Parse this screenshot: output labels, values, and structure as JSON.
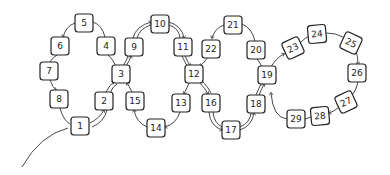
{
  "diagram": {
    "type": "hand-drawn loop path diagram",
    "nodes": [
      {
        "id": "1",
        "label": "1",
        "x": 80,
        "y": 126,
        "rot": 0
      },
      {
        "id": "2",
        "label": "2",
        "x": 104,
        "y": 101,
        "rot": 0
      },
      {
        "id": "3",
        "label": "3",
        "x": 121,
        "y": 74,
        "rot": 0
      },
      {
        "id": "4",
        "label": "4",
        "x": 106,
        "y": 46,
        "rot": 0
      },
      {
        "id": "5",
        "label": "5",
        "x": 84,
        "y": 23,
        "rot": 0
      },
      {
        "id": "6",
        "label": "6",
        "x": 60,
        "y": 46,
        "rot": 0
      },
      {
        "id": "7",
        "label": "7",
        "x": 49,
        "y": 71,
        "rot": 0
      },
      {
        "id": "8",
        "label": "8",
        "x": 59,
        "y": 99,
        "rot": 0
      },
      {
        "id": "9",
        "label": "9",
        "x": 134,
        "y": 47,
        "rot": 0
      },
      {
        "id": "10",
        "label": "10",
        "x": 160,
        "y": 24,
        "rot": 0
      },
      {
        "id": "11",
        "label": "11",
        "x": 183,
        "y": 47,
        "rot": 0
      },
      {
        "id": "12",
        "label": "12",
        "x": 194,
        "y": 74,
        "rot": 0
      },
      {
        "id": "13",
        "label": "13",
        "x": 181,
        "y": 103,
        "rot": 0
      },
      {
        "id": "14",
        "label": "14",
        "x": 156,
        "y": 128,
        "rot": 0
      },
      {
        "id": "15",
        "label": "15",
        "x": 135,
        "y": 101,
        "rot": 0
      },
      {
        "id": "16",
        "label": "16",
        "x": 211,
        "y": 103,
        "rot": 0
      },
      {
        "id": "17",
        "label": "17",
        "x": 231,
        "y": 130,
        "rot": 0
      },
      {
        "id": "18",
        "label": "18",
        "x": 256,
        "y": 104,
        "rot": 0
      },
      {
        "id": "19",
        "label": "19",
        "x": 267,
        "y": 75,
        "rot": 0
      },
      {
        "id": "20",
        "label": "20",
        "x": 256,
        "y": 50,
        "rot": 0
      },
      {
        "id": "21",
        "label": "21",
        "x": 233,
        "y": 25,
        "rot": 0
      },
      {
        "id": "22",
        "label": "22",
        "x": 211,
        "y": 49,
        "rot": 0
      },
      {
        "id": "23",
        "label": "23",
        "x": 293,
        "y": 48,
        "rot": -25
      },
      {
        "id": "24",
        "label": "24",
        "x": 317,
        "y": 34,
        "rot": -5
      },
      {
        "id": "25",
        "label": "25",
        "x": 351,
        "y": 43,
        "rot": 25
      },
      {
        "id": "26",
        "label": "26",
        "x": 357,
        "y": 73,
        "rot": 0
      },
      {
        "id": "27",
        "label": "27",
        "x": 346,
        "y": 102,
        "rot": -25
      },
      {
        "id": "28",
        "label": "28",
        "x": 320,
        "y": 116,
        "rot": -5
      },
      {
        "id": "29",
        "label": "29",
        "x": 296,
        "y": 119,
        "rot": 0
      }
    ],
    "edges": [
      {
        "from": "start",
        "to": "1"
      },
      {
        "from": "1",
        "to": "2"
      },
      {
        "from": "2",
        "to": "3"
      },
      {
        "from": "3",
        "to": "4"
      },
      {
        "from": "4",
        "to": "5"
      },
      {
        "from": "5",
        "to": "6"
      },
      {
        "from": "6",
        "to": "7"
      },
      {
        "from": "7",
        "to": "8"
      },
      {
        "from": "8",
        "to": "1"
      },
      {
        "from": "1",
        "to": "2"
      },
      {
        "from": "2",
        "to": "3"
      },
      {
        "from": "3",
        "to": "9"
      },
      {
        "from": "9",
        "to": "10"
      },
      {
        "from": "10",
        "to": "11"
      },
      {
        "from": "11",
        "to": "12"
      },
      {
        "from": "12",
        "to": "13"
      },
      {
        "from": "13",
        "to": "14"
      },
      {
        "from": "14",
        "to": "15"
      },
      {
        "from": "15",
        "to": "3"
      },
      {
        "from": "3",
        "to": "9"
      },
      {
        "from": "9",
        "to": "10"
      },
      {
        "from": "10",
        "to": "11"
      },
      {
        "from": "11",
        "to": "12"
      },
      {
        "from": "12",
        "to": "16"
      },
      {
        "from": "16",
        "to": "17"
      },
      {
        "from": "17",
        "to": "18"
      },
      {
        "from": "18",
        "to": "19"
      },
      {
        "from": "19",
        "to": "20"
      },
      {
        "from": "20",
        "to": "21"
      },
      {
        "from": "21",
        "to": "22"
      },
      {
        "from": "22",
        "to": "12"
      },
      {
        "from": "12",
        "to": "16"
      },
      {
        "from": "16",
        "to": "17"
      },
      {
        "from": "17",
        "to": "18"
      },
      {
        "from": "18",
        "to": "19"
      },
      {
        "from": "19",
        "to": "23"
      },
      {
        "from": "23",
        "to": "24"
      },
      {
        "from": "24",
        "to": "25"
      },
      {
        "from": "25",
        "to": "26"
      },
      {
        "from": "26",
        "to": "27"
      },
      {
        "from": "27",
        "to": "28"
      },
      {
        "from": "28",
        "to": "29"
      },
      {
        "from": "29",
        "to": "19"
      }
    ]
  }
}
